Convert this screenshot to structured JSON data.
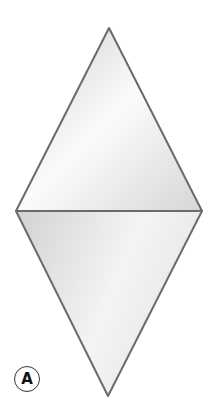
{
  "figure": {
    "label": "A",
    "shape": "rhombus-two-triangles",
    "colors": {
      "stroke": "#6b6b6b",
      "fill_light": "#fbfbfb",
      "fill_dark": "#cfcfcf"
    }
  }
}
